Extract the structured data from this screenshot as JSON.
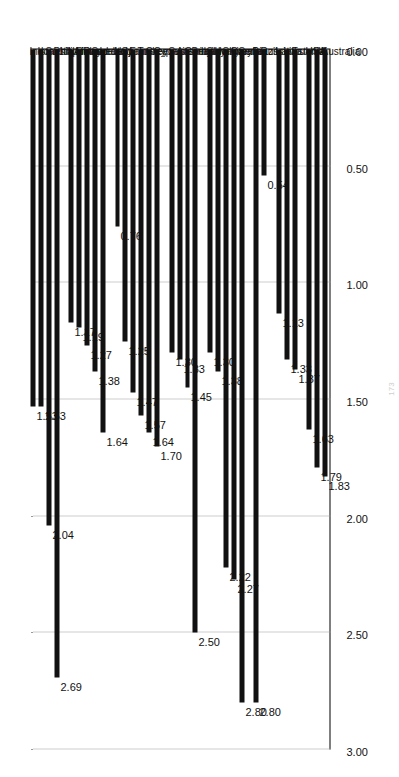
{
  "chart_data": {
    "type": "bar",
    "orientation": "horizontal",
    "title": "",
    "subtitle": "",
    "xlabel": "",
    "ylabel": "",
    "xlim": [
      0.0,
      3.0
    ],
    "axis_reversed": true,
    "grid": true,
    "legend": null,
    "tick_labels": [
      "3.00",
      "2.50",
      "2.00",
      "1.50",
      "1.00",
      "0.50",
      "0.00"
    ],
    "tick_values": [
      3.0,
      2.5,
      2.0,
      1.5,
      1.0,
      0.5,
      0.0
    ],
    "bar_color": "#111111",
    "categories": [
      "Indonesia",
      "Israel",
      "South Africa",
      "Philippines",
      "Norway",
      "Finland",
      "Denmark",
      "Sweden",
      "Iceland",
      "Italy",
      "Spain",
      "France",
      "Turkey",
      "Greece",
      "Cyprus",
      "Switzerland",
      "Austria",
      "Germany",
      "Belgium",
      "Slovakia",
      "Hungary",
      "Slovenia",
      "Croatia",
      "Serbia",
      "Brazil",
      "Russia",
      "Latvia",
      "Lithuania",
      "Estonia",
      "USA",
      "UK",
      "Australia"
    ],
    "values": [
      1.53,
      1.53,
      2.04,
      2.69,
      1.17,
      1.19,
      1.27,
      1.38,
      1.64,
      0.76,
      1.25,
      1.47,
      1.57,
      1.64,
      1.7,
      1.3,
      1.33,
      1.45,
      2.5,
      1.3,
      1.38,
      2.22,
      2.27,
      2.8,
      2.8,
      0.54,
      1.13,
      1.33,
      1.37,
      1.63,
      1.79,
      1.83
    ],
    "value_labels": [
      "1.53",
      "1.53",
      "2.04",
      "2.69",
      "1.17",
      "1.19",
      "1.27",
      "1.38",
      "1.64",
      "0.76",
      "1.25",
      "1.47",
      "1.57",
      "1.64",
      "1.70",
      "1.30",
      "1.33",
      "1.45",
      "2.50",
      "1.30",
      "1.38",
      "2.22",
      "2.27",
      "2.80",
      "2.80",
      "0.54",
      "1.13",
      "1.33",
      "1.37",
      "1.63",
      "1.79",
      "1.83"
    ],
    "group_gaps_after": [
      3,
      8,
      14,
      18,
      23,
      25,
      28
    ]
  },
  "page": {
    "page_mark": "173"
  }
}
